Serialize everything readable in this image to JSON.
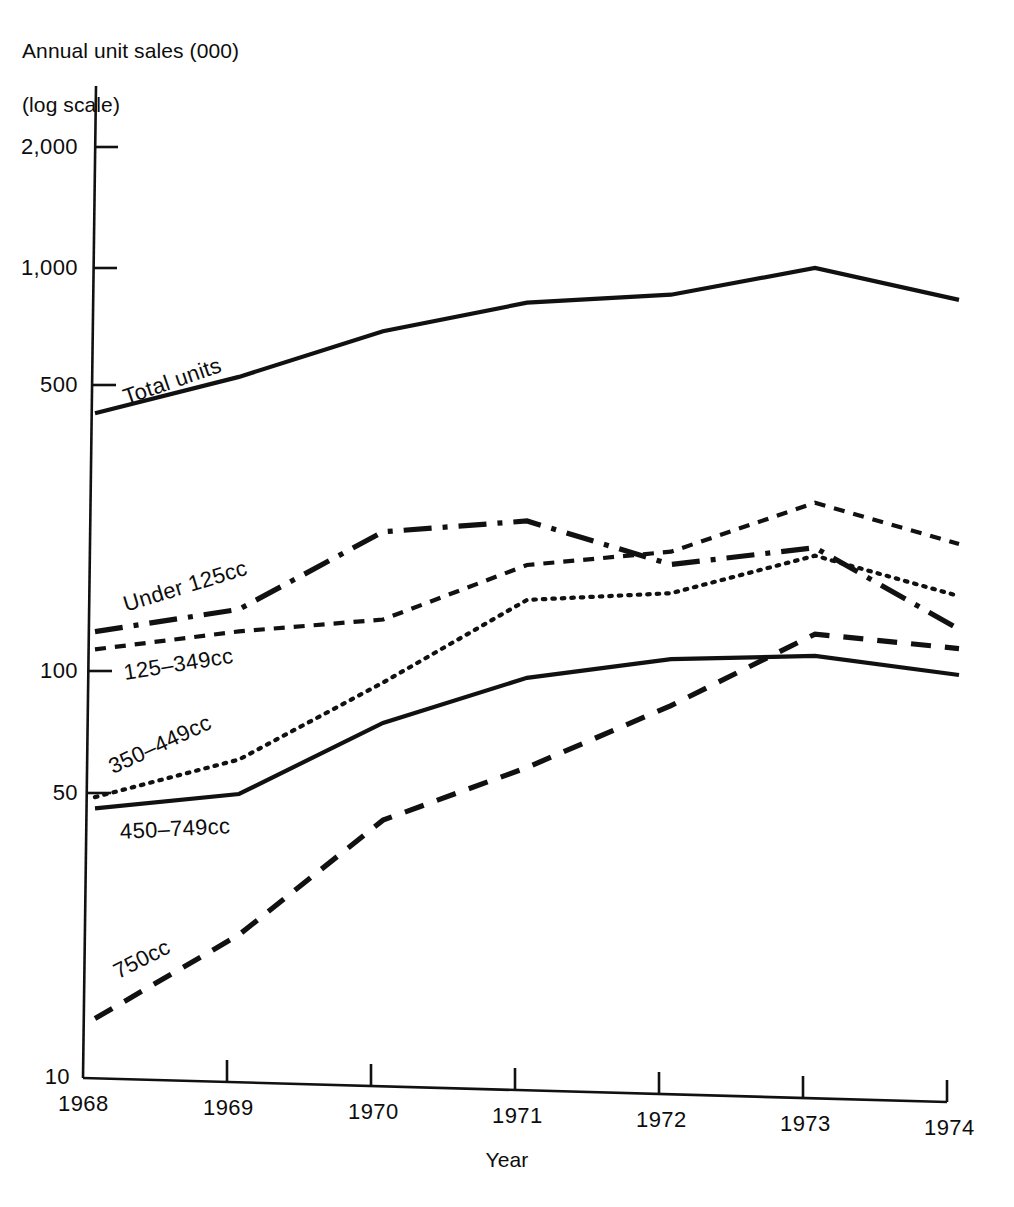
{
  "chart_data": {
    "type": "line",
    "title": "",
    "ylabel": "Annual unit sales (000)\n(log scale)",
    "ylabel_line1": "Annual unit sales (000)",
    "ylabel_line2": "(log scale)",
    "xlabel": "Year",
    "log_scale": true,
    "grid": false,
    "legend_position": "inline-labels",
    "x": [
      1968,
      1969,
      1970,
      1971,
      1972,
      1973,
      1974
    ],
    "xticklabels": [
      "1968",
      "1969",
      "1970",
      "1971",
      "1972",
      "1973",
      "1974"
    ],
    "yticks": [
      10,
      50,
      100,
      500,
      1000,
      2000
    ],
    "yticklabels": [
      "10",
      "50",
      "100",
      "500",
      "1,000",
      "2,000"
    ],
    "ylim": [
      10,
      2600
    ],
    "series": [
      {
        "name": "Total units",
        "label": "Total units",
        "style": "solid",
        "values": [
          430,
          540,
          715,
          860,
          920,
          1095,
          935
        ]
      },
      {
        "name": "Under 125cc",
        "label": "Under 125cc",
        "style": "dash-dot",
        "values": [
          125,
          145,
          230,
          250,
          200,
          225,
          145
        ]
      },
      {
        "name": "125-349cc",
        "label": "125–349cc",
        "style": "short-dash",
        "values": [
          113,
          128,
          140,
          195,
          215,
          290,
          235
        ]
      },
      {
        "name": "350-449cc",
        "label": "350–449cc",
        "style": "dotted",
        "values": [
          49,
          62,
          98,
          160,
          170,
          215,
          175
        ]
      },
      {
        "name": "450-749cc",
        "label": "450–749cc",
        "style": "solid",
        "values": [
          46,
          51,
          78,
          103,
          117,
          122,
          112
        ]
      },
      {
        "name": "750cc",
        "label": "750cc",
        "style": "long-dash",
        "values": [
          14,
          23,
          45,
          62,
          90,
          138,
          130
        ]
      }
    ]
  },
  "axis_titles": {
    "y_line1": "Annual unit sales (000)",
    "y_line2": "(log scale)",
    "x": "Year"
  },
  "ticks": {
    "y": [
      {
        "label": "2,000",
        "value": 2000
      },
      {
        "label": "1,000",
        "value": 1000
      },
      {
        "label": "500",
        "value": 500
      },
      {
        "label": "100",
        "value": 100
      },
      {
        "label": "50",
        "value": 50
      },
      {
        "label": "10",
        "value": 10
      }
    ],
    "x": [
      {
        "label": "1968",
        "value": 1968
      },
      {
        "label": "1969",
        "value": 1969
      },
      {
        "label": "1970",
        "value": 1970
      },
      {
        "label": "1971",
        "value": 1971
      },
      {
        "label": "1972",
        "value": 1972
      },
      {
        "label": "1973",
        "value": 1973
      },
      {
        "label": "1974",
        "value": 1974
      }
    ]
  },
  "series_labels": {
    "total_units": "Total units",
    "under_125cc": "Under 125cc",
    "cc_125_349": "125–349cc",
    "cc_350_449": "350–449cc",
    "cc_450_749": "450–749cc",
    "cc_750": "750cc"
  },
  "colors": {
    "ink": "#111111",
    "background": "#ffffff"
  }
}
